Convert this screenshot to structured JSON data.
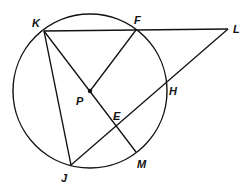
{
  "diagram": {
    "circle": {
      "cx": 90,
      "cy": 91,
      "r": 77
    },
    "points": {
      "K": {
        "x": 44,
        "y": 31,
        "label": "K",
        "lx": 32,
        "ly": 27
      },
      "F": {
        "x": 136,
        "y": 30,
        "label": "F",
        "lx": 135,
        "ly": 24
      },
      "L": {
        "x": 228,
        "y": 29,
        "label": "L",
        "lx": 233,
        "ly": 33
      },
      "P": {
        "x": 90,
        "y": 91,
        "label": "P",
        "lx": 76,
        "ly": 104
      },
      "H": {
        "x": 166,
        "y": 84,
        "label": "H",
        "lx": 169,
        "ly": 95
      },
      "E": {
        "x": 116,
        "y": 127,
        "label": "E",
        "lx": 113,
        "ly": 120
      },
      "M": {
        "x": 136,
        "y": 152,
        "label": "M",
        "lx": 137,
        "ly": 167
      },
      "J": {
        "x": 71,
        "y": 165,
        "label": "J",
        "lx": 61,
        "ly": 181
      }
    },
    "segments": [
      [
        "K",
        "L"
      ],
      [
        "K",
        "J"
      ],
      [
        "K",
        "M"
      ],
      [
        "P",
        "F"
      ],
      [
        "J",
        "L"
      ]
    ],
    "center_dot": "P"
  }
}
